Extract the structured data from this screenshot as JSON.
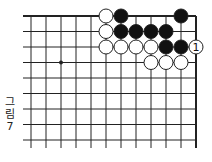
{
  "diagram": {
    "type": "go-board-fragment",
    "caption": {
      "word": "그림",
      "number": "7",
      "chars": [
        "그",
        "림",
        "7"
      ]
    },
    "grid": {
      "columns": 12,
      "rows": 9,
      "origin_x": 31,
      "origin_y": 16,
      "spacing_x": 15,
      "spacing_y": 15.5,
      "top_edge": true,
      "right_edge": true,
      "line_color": "#222222",
      "left_stub_x": 23,
      "bottom_stub_y": 148
    },
    "star_points": [
      {
        "col": 2,
        "row": 3
      }
    ],
    "stones": [
      {
        "col": 5,
        "row": 0,
        "color": "white"
      },
      {
        "col": 6,
        "row": 0,
        "color": "black"
      },
      {
        "col": 10,
        "row": 0,
        "color": "black"
      },
      {
        "col": 5,
        "row": 1,
        "color": "white"
      },
      {
        "col": 6,
        "row": 1,
        "color": "black"
      },
      {
        "col": 7,
        "row": 1,
        "color": "black"
      },
      {
        "col": 8,
        "row": 1,
        "color": "black"
      },
      {
        "col": 9,
        "row": 1,
        "color": "black"
      },
      {
        "col": 5,
        "row": 2,
        "color": "white"
      },
      {
        "col": 6,
        "row": 2,
        "color": "white"
      },
      {
        "col": 7,
        "row": 2,
        "color": "white"
      },
      {
        "col": 8,
        "row": 2,
        "color": "white"
      },
      {
        "col": 9,
        "row": 2,
        "color": "black"
      },
      {
        "col": 10,
        "row": 2,
        "color": "black"
      },
      {
        "col": 11,
        "row": 2,
        "color": "white",
        "label": "1"
      },
      {
        "col": 8,
        "row": 3,
        "color": "white"
      },
      {
        "col": 9,
        "row": 3,
        "color": "white"
      },
      {
        "col": 10,
        "row": 3,
        "color": "white"
      }
    ],
    "colors": {
      "black_stone": "#111111",
      "white_stone": "#ffffff",
      "stone_outline": "#222222"
    }
  }
}
